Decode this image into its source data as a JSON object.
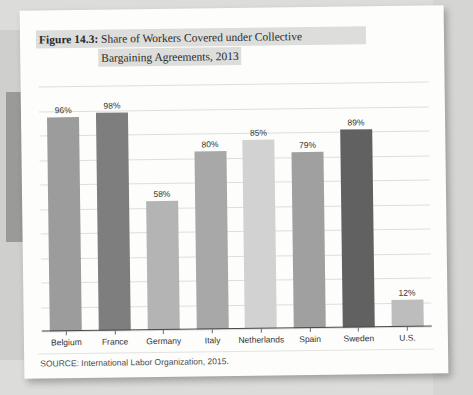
{
  "figure": {
    "label": "Figure 14.3:",
    "title_line_1": "Share of Workers Covered under Collective",
    "title_line_2": "Bargaining Agreements, 2013"
  },
  "source": {
    "text": "SOURCE: International Labor Organization, 2015."
  },
  "chart_data": {
    "type": "bar",
    "title": "Figure 14.3: Share of Workers Covered under Collective Bargaining Agreements, 2013",
    "xlabel": "",
    "ylabel": "",
    "ylim": [
      0,
      110
    ],
    "grid": true,
    "legend": false,
    "categories": [
      "Belgium",
      "France",
      "Germany",
      "Italy",
      "Netherlands",
      "Spain",
      "Sweden",
      "U.S."
    ],
    "values": [
      96,
      98,
      58,
      80,
      85,
      79,
      89,
      12
    ],
    "value_labels": [
      "96%",
      "98%",
      "58%",
      "80%",
      "85%",
      "79%",
      "89%",
      "12%"
    ],
    "bar_colors": [
      "#9c9c9c",
      "#7e7e7e",
      "#b4b4b4",
      "#a8a8a8",
      "#d2d2d2",
      "#a0a0a0",
      "#616161",
      "#bdbdbd"
    ],
    "gridline_count": 10
  },
  "colors": {
    "page_background": "#fdfdfc",
    "surround_background": "#dcdcda",
    "axis": "#4a4a4a",
    "gridline": "#dededc",
    "title_highlight": "#dddddb",
    "text": "#2b2b2b"
  }
}
